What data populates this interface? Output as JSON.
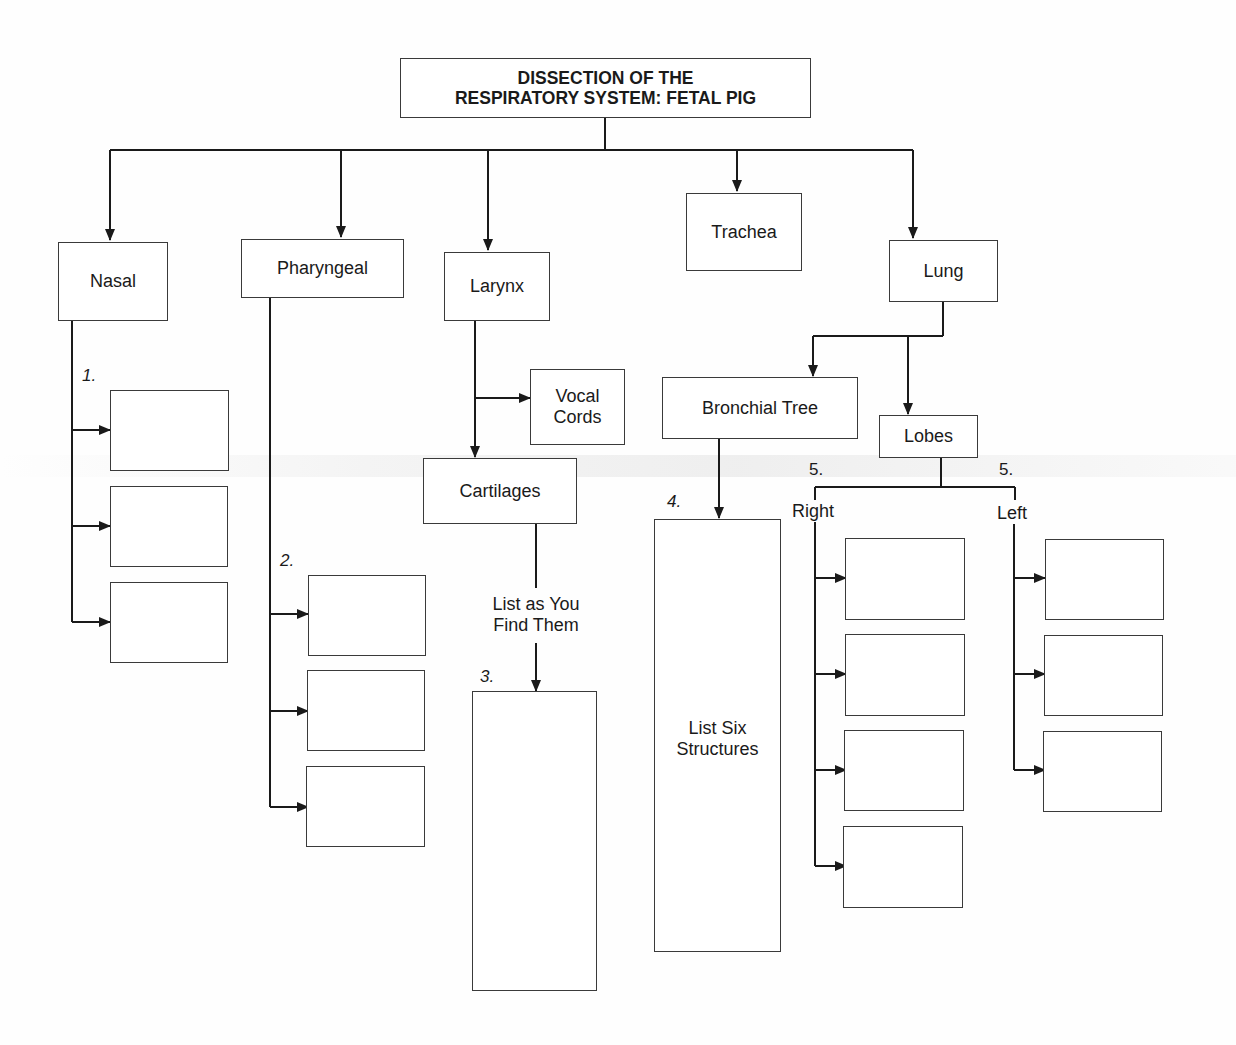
{
  "title": "DISSECTION OF THE\nRESPIRATORY SYSTEM: FETAL PIG",
  "title_lines": [
    "DISSECTION OF THE",
    "RESPIRATORY SYSTEM: FETAL PIG"
  ],
  "categories": {
    "nasal": "Nasal",
    "pharyngeal": "Pharyngeal",
    "larynx": "Larynx",
    "trachea": "Trachea",
    "lung": "Lung"
  },
  "larynx_children": {
    "vocal_cords": [
      "Vocal",
      "Cords"
    ],
    "cartilages": "Cartilages",
    "instruction": [
      "List as You",
      "Find Them"
    ]
  },
  "lung_children": {
    "bronchial_tree": "Bronchial Tree",
    "bronchial_instruction": [
      "List Six",
      "Structures"
    ],
    "lobes": "Lobes",
    "right": "Right",
    "left": "Left"
  },
  "numbers": {
    "n1": "1.",
    "n2": "2.",
    "n3": "3.",
    "n4": "4.",
    "n5_right": "5.",
    "n5_left": "5."
  },
  "blank_boxes": {
    "nasal": 3,
    "pharyngeal": 3,
    "cartilages": 1,
    "bronchial": 1,
    "right_lobes": 4,
    "left_lobes": 3
  }
}
